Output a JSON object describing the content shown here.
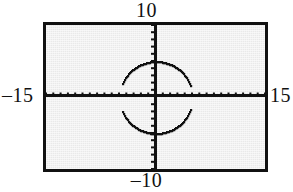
{
  "figure": {
    "kind": "graphing-calculator-screen",
    "background_color": "#e9e9e9",
    "ink_color": "#111111"
  },
  "window_labels": {
    "ymax": "10",
    "ymin": "–10",
    "xmin": "–15",
    "xmax": "15"
  },
  "chart_data": {
    "type": "scatter",
    "title": "",
    "xlabel": "",
    "ylabel": "",
    "xlim": [
      -15,
      15
    ],
    "ylim": [
      -10,
      10
    ],
    "grid": false,
    "legend": "none",
    "axes": {
      "x_axis_visible": true,
      "y_axis_visible": true,
      "x_tick_spacing": 1,
      "y_tick_spacing": 1,
      "tick_marks": true,
      "tick_labels": false
    },
    "annotations": [
      "10",
      "–10",
      "–15",
      "15"
    ],
    "series": [
      {
        "name": "circle x^2 + y^2 = 25 (upper semicircle)",
        "equation": "y = sqrt(25 - x^2)",
        "center": [
          0,
          0
        ],
        "radius": 5,
        "branch": "upper",
        "x": [
          -5,
          -4.5,
          -4,
          -3.5,
          -3,
          -2.5,
          -2,
          -1.5,
          -1,
          -0.5,
          0,
          0.5,
          1,
          1.5,
          2,
          2.5,
          3,
          3.5,
          4,
          4.5,
          5
        ],
        "values": [
          0,
          2.18,
          3,
          3.57,
          4,
          4.33,
          4.58,
          4.77,
          4.9,
          4.97,
          5,
          4.97,
          4.9,
          4.77,
          4.58,
          4.33,
          4,
          3.57,
          3,
          2.18,
          0
        ]
      },
      {
        "name": "circle x^2 + y^2 = 25 (lower semicircle)",
        "equation": "y = -sqrt(25 - x^2)",
        "center": [
          0,
          0
        ],
        "radius": 5,
        "branch": "lower",
        "x": [
          -5,
          -4.5,
          -4,
          -3.5,
          -3,
          -2.5,
          -2,
          -1.5,
          -1,
          -0.5,
          0,
          0.5,
          1,
          1.5,
          2,
          2.5,
          3,
          3.5,
          4,
          4.5,
          5
        ],
        "values": [
          0,
          -2.18,
          -3,
          -3.57,
          -4,
          -4.33,
          -4.58,
          -4.77,
          -4.9,
          -4.97,
          -5,
          -4.97,
          -4.9,
          -4.77,
          -4.58,
          -4.33,
          -4,
          -3.57,
          -3,
          -2.18,
          0
        ]
      }
    ]
  }
}
